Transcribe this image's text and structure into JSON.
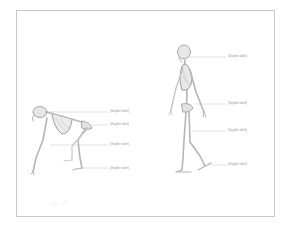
{
  "diagram": {
    "title": "",
    "note": "Caption text is too small to read in the source image; placeholders mark each caption's position without guessing its content.",
    "figures": [
      {
        "id": "ape",
        "description": "quadrupedal ape skeleton in side view, knuckle-walking posture"
      },
      {
        "id": "human",
        "description": "bipedal human skeleton in side view, mid-stride"
      }
    ],
    "labels": {
      "ape": [
        {
          "line1": "[illegible label]",
          "line2": "",
          "points_to": "skull / upper spine"
        },
        {
          "line1": "[illegible label]",
          "line2": "",
          "points_to": "pelvis / hips"
        },
        {
          "line1": "[illegible label]",
          "line2": "",
          "points_to": "forelimbs"
        },
        {
          "line1": "[illegible label]",
          "line2": "",
          "points_to": "feet"
        }
      ],
      "human": [
        {
          "line1": "[illegible label]",
          "line2": "",
          "points_to": "skull"
        },
        {
          "line1": "[illegible label]",
          "line2": "",
          "points_to": "pelvis"
        },
        {
          "line1": "[illegible label]",
          "line2": "",
          "points_to": "legs / knees"
        },
        {
          "line1": "[illegible label]",
          "line2": "",
          "points_to": "feet"
        }
      ]
    },
    "colors": {
      "frame": "#c9c9c9",
      "bone": "#b5b5b5",
      "bone_shade": "#8f8f8f",
      "leader_line": "#cfcfcf",
      "label_text": "#9a9a9a"
    }
  }
}
